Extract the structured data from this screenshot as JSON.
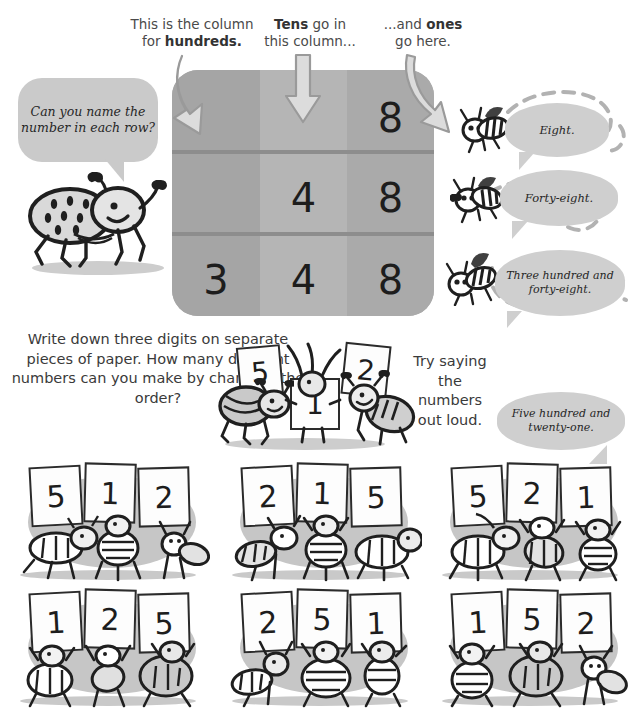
{
  "page": {
    "background_color": "#ffffff",
    "ink_color": "#2b2b2b",
    "panel_gray": "#a9a9a9",
    "bubble_gray": "#cfcfcf",
    "blob_gray": "#c6c6c6"
  },
  "captions": [
    {
      "id": "hundreds",
      "line1": "This is the column",
      "line2_prefix": "for ",
      "line2_bold": "hundreds."
    },
    {
      "id": "tens",
      "line1_bold": "Tens",
      "line1_suffix": " go in",
      "line2": "this column..."
    },
    {
      "id": "ones",
      "line1_prefix": "...and ",
      "line1_bold": "ones",
      "line2": "go here."
    }
  ],
  "table": {
    "columns": [
      "hundreds",
      "tens",
      "ones"
    ],
    "rows": [
      {
        "hundreds": "",
        "tens": "",
        "ones": "8"
      },
      {
        "hundreds": "",
        "tens": "4",
        "ones": "8"
      },
      {
        "hundreds": "3",
        "tens": "4",
        "ones": "8"
      }
    ]
  },
  "arrows": [
    {
      "id": "arrow-hundreds"
    },
    {
      "id": "arrow-tens"
    },
    {
      "id": "arrow-ones"
    }
  ],
  "bubbles": {
    "ask": "Can you name the number in each row?",
    "eight": "Eight.",
    "forty_eight": "Forty-eight.",
    "three_hundred": "Three hundred and forty-eight.",
    "five_twenty_one": "Five hundred and twenty-one."
  },
  "instructions": {
    "write": "Write down three digits on separate pieces of paper. How many different numbers can you make by changing the order?",
    "out_loud": "Try saying the numbers out loud."
  },
  "mid_trio": {
    "digits": [
      "5",
      "1",
      "2"
    ]
  },
  "permutation_groups": [
    {
      "id": "group-512",
      "digits": [
        "5",
        "1",
        "2"
      ]
    },
    {
      "id": "group-215",
      "digits": [
        "2",
        "1",
        "5"
      ]
    },
    {
      "id": "group-521",
      "digits": [
        "5",
        "2",
        "1"
      ]
    },
    {
      "id": "group-125",
      "digits": [
        "1",
        "2",
        "5"
      ]
    },
    {
      "id": "group-251",
      "digits": [
        "2",
        "5",
        "1"
      ]
    },
    {
      "id": "group-152",
      "digits": [
        "1",
        "5",
        "2"
      ]
    }
  ]
}
